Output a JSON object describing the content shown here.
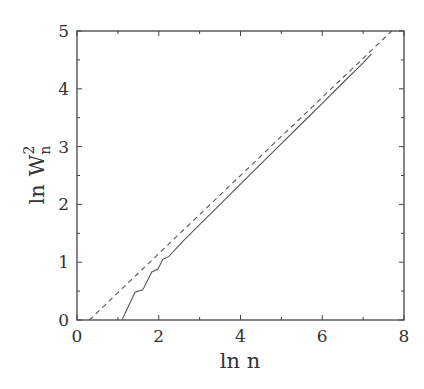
{
  "chart_data": {
    "type": "line",
    "title": "",
    "xlabel": "ln n",
    "ylabel": {
      "prefix": "ln",
      "symbol": "W",
      "superscript": "2",
      "subscript": "n"
    },
    "xlim": [
      0,
      8
    ],
    "ylim": [
      0,
      5
    ],
    "xticks": [
      0,
      2,
      4,
      6,
      8
    ],
    "xtick_labels": [
      "0",
      "2",
      "4",
      "6",
      "8"
    ],
    "xminor_ticks": [
      1,
      3,
      5,
      7
    ],
    "yticks": [
      0,
      1,
      2,
      3,
      4,
      5
    ],
    "ytick_labels": [
      "0",
      "1",
      "2",
      "3",
      "4",
      "5"
    ],
    "yminor_ticks": [
      0.5,
      1.5,
      2.5,
      3.5,
      4.5
    ],
    "grid": false,
    "legend": null,
    "series": [
      {
        "name": "simulation",
        "style": "solid",
        "x": [
          1.1,
          1.42,
          1.61,
          1.83,
          1.98,
          2.1,
          2.25,
          2.4,
          2.6,
          3.0,
          3.5,
          4.0,
          4.5,
          5.0,
          5.5,
          6.0,
          6.5,
          7.0,
          7.2
        ],
        "y": [
          0.0,
          0.48,
          0.52,
          0.83,
          0.88,
          1.05,
          1.1,
          1.22,
          1.37,
          1.65,
          2.0,
          2.35,
          2.7,
          3.05,
          3.4,
          3.75,
          4.1,
          4.45,
          4.6
        ]
      },
      {
        "name": "fit",
        "style": "dashed",
        "x": [
          0.3,
          7.7
        ],
        "y": [
          0.0,
          5.0
        ]
      }
    ]
  }
}
